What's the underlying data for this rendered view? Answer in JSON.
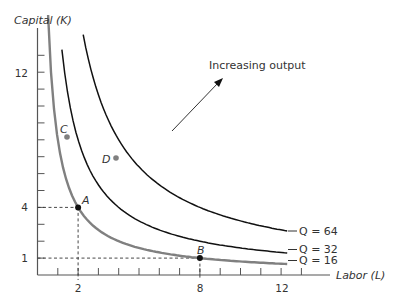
{
  "chart_data": {
    "type": "line",
    "title": "",
    "xlabel": "Labor (L)",
    "ylabel": "Capital (K)",
    "xlim": [
      0,
      15
    ],
    "ylim": [
      0,
      14
    ],
    "x_ticks": [
      1,
      2,
      3,
      4,
      5,
      6,
      7,
      8,
      9,
      10,
      11,
      12,
      13
    ],
    "x_tick_labels": {
      "2": "2",
      "8": "8",
      "12": "12"
    },
    "y_ticks": [
      1,
      2,
      3,
      4,
      5,
      6,
      7,
      8,
      9,
      10,
      11,
      12,
      13
    ],
    "y_tick_labels": {
      "1": "1",
      "4": "4",
      "12": "12"
    },
    "grid": false,
    "series": [
      {
        "name": "Q = 16",
        "equation": "K = 8/L",
        "color": "#808080",
        "x_range": [
          1.15,
          13
        ],
        "sample_points": [
          [
            1.2,
            6.67
          ],
          [
            2,
            4
          ],
          [
            4,
            2
          ],
          [
            8,
            1
          ],
          [
            13,
            0.62
          ]
        ]
      },
      {
        "name": "Q = 32",
        "equation": "K = 16/L",
        "color": "#111111",
        "x_range": [
          2.2,
          13
        ],
        "sample_points": [
          [
            2.3,
            6.96
          ],
          [
            4,
            4
          ],
          [
            8,
            2
          ],
          [
            13,
            1.23
          ]
        ]
      },
      {
        "name": "Q = 64",
        "equation": "K = 32/L",
        "color": "#111111",
        "x_range": [
          2.2,
          13
        ],
        "sample_points": [
          [
            2.3,
            13.9
          ],
          [
            4,
            8
          ],
          [
            8,
            4
          ],
          [
            13,
            2.46
          ]
        ]
      }
    ],
    "points": [
      {
        "label": "A",
        "x": 2,
        "y": 4,
        "color": "#111111",
        "dashed_guides": true
      },
      {
        "label": "B",
        "x": 8,
        "y": 1,
        "color": "#111111",
        "dashed_guides": true
      },
      {
        "label": "C",
        "x": 1.45,
        "y": 8.2,
        "color": "#808080"
      },
      {
        "label": "D",
        "x": 3.85,
        "y": 6.9,
        "color": "#808080"
      }
    ],
    "annotations": [
      {
        "text": "Increasing output",
        "arrow": {
          "from": [
            6.6,
            8.5
          ],
          "to": [
            9.0,
            11.6
          ]
        }
      }
    ],
    "legend": "curve-end labels at right"
  },
  "labels": {
    "ylabel": "Capital (K)",
    "xlabel": "Labor (L)",
    "annotation": "Increasing output",
    "q16": "Q = 16",
    "q32": "Q = 32",
    "q64": "Q = 64",
    "pA": "A",
    "pB": "B",
    "pC": "C",
    "pD": "D",
    "t2": "2",
    "t8": "8",
    "t12": "12",
    "t1": "1",
    "t4": "4",
    "ty12": "12"
  }
}
